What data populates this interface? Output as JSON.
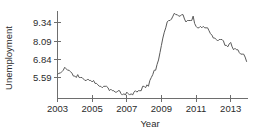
{
  "chart_data": {
    "type": "line",
    "title": "",
    "xlabel": "Year",
    "ylabel": "Unemployment",
    "xlim": [
      2003.0,
      2014.0
    ],
    "ylim": [
      4.2,
      10.15
    ],
    "grid": false,
    "legend": "none",
    "xticks": [
      2003,
      2005,
      2007,
      2009,
      2011,
      2013
    ],
    "xtick_labels": [
      "2003",
      "2005",
      "2007",
      "2009",
      "2011",
      "2013"
    ],
    "yticks": [
      5.59,
      6.84,
      8.09,
      9.34
    ],
    "ytick_labels": [
      "5.59",
      "6.84",
      "8.09",
      "9.34"
    ],
    "line_color": "#595959",
    "axis_color": "#6e6e6e",
    "background_color": "#ffffff",
    "series": [
      {
        "name": "Unemployment",
        "x": [
          2003.0,
          2003.083,
          2003.167,
          2003.25,
          2003.333,
          2003.417,
          2003.5,
          2003.583,
          2003.667,
          2003.75,
          2003.833,
          2003.917,
          2004.0,
          2004.083,
          2004.167,
          2004.25,
          2004.333,
          2004.417,
          2004.5,
          2004.583,
          2004.667,
          2004.75,
          2004.833,
          2004.917,
          2005.0,
          2005.083,
          2005.167,
          2005.25,
          2005.333,
          2005.417,
          2005.5,
          2005.583,
          2005.667,
          2005.75,
          2005.833,
          2005.917,
          2006.0,
          2006.083,
          2006.167,
          2006.25,
          2006.333,
          2006.417,
          2006.5,
          2006.583,
          2006.667,
          2006.75,
          2006.833,
          2006.917,
          2007.0,
          2007.083,
          2007.167,
          2007.25,
          2007.333,
          2007.417,
          2007.5,
          2007.583,
          2007.667,
          2007.75,
          2007.833,
          2007.917,
          2008.0,
          2008.083,
          2008.167,
          2008.25,
          2008.333,
          2008.417,
          2008.5,
          2008.583,
          2008.667,
          2008.75,
          2008.833,
          2008.917,
          2009.0,
          2009.083,
          2009.167,
          2009.25,
          2009.333,
          2009.417,
          2009.5,
          2009.583,
          2009.667,
          2009.75,
          2009.833,
          2009.917,
          2010.0,
          2010.083,
          2010.167,
          2010.25,
          2010.333,
          2010.417,
          2010.5,
          2010.583,
          2010.667,
          2010.75,
          2010.833,
          2010.917,
          2011.0,
          2011.083,
          2011.167,
          2011.25,
          2011.333,
          2011.417,
          2011.5,
          2011.583,
          2011.667,
          2011.75,
          2011.833,
          2011.917,
          2012.0,
          2012.083,
          2012.167,
          2012.25,
          2012.333,
          2012.417,
          2012.5,
          2012.583,
          2012.667,
          2012.75,
          2012.833,
          2012.917,
          2013.0,
          2013.083,
          2013.167,
          2013.25,
          2013.333,
          2013.417,
          2013.5,
          2013.583,
          2013.667,
          2013.75,
          2013.833,
          2013.917
        ],
        "values": [
          5.8,
          5.9,
          5.9,
          6.0,
          6.1,
          6.3,
          6.2,
          6.1,
          6.1,
          6.0,
          5.9,
          5.7,
          5.7,
          5.6,
          5.8,
          5.6,
          5.6,
          5.6,
          5.5,
          5.4,
          5.4,
          5.5,
          5.4,
          5.4,
          5.3,
          5.4,
          5.2,
          5.2,
          5.1,
          5.0,
          5.0,
          4.9,
          5.0,
          5.0,
          5.0,
          4.9,
          4.7,
          4.8,
          4.7,
          4.7,
          4.6,
          4.6,
          4.7,
          4.7,
          4.5,
          4.4,
          4.5,
          4.4,
          4.6,
          4.5,
          4.4,
          4.5,
          4.4,
          4.6,
          4.7,
          4.6,
          4.7,
          4.7,
          4.7,
          5.0,
          5.0,
          4.9,
          5.1,
          5.0,
          5.4,
          5.6,
          5.8,
          6.1,
          6.1,
          6.5,
          6.8,
          7.3,
          7.8,
          8.3,
          8.7,
          9.0,
          9.4,
          9.5,
          9.5,
          9.6,
          9.8,
          10.0,
          9.9,
          9.9,
          9.8,
          9.8,
          9.9,
          9.9,
          9.6,
          9.4,
          9.5,
          9.5,
          9.5,
          9.5,
          9.8,
          9.3,
          9.1,
          9.0,
          9.0,
          9.1,
          9.0,
          9.1,
          9.0,
          9.0,
          9.0,
          8.8,
          8.6,
          8.5,
          8.3,
          8.3,
          8.2,
          8.1,
          8.2,
          8.2,
          8.2,
          8.1,
          7.8,
          7.8,
          7.7,
          7.9,
          8.0,
          7.7,
          7.5,
          7.6,
          7.5,
          7.5,
          7.3,
          7.2,
          7.2,
          7.2,
          7.0,
          6.7
        ]
      }
    ]
  },
  "axes": {
    "y_title": "Unemployment",
    "x_title": "Year"
  }
}
